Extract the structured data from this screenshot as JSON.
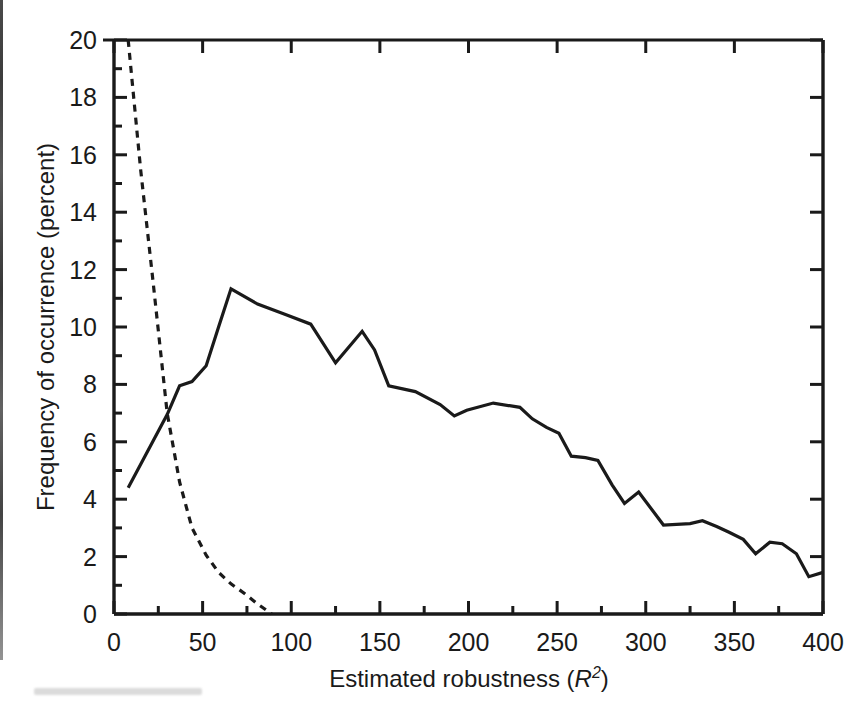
{
  "chart_data": {
    "type": "line",
    "title": "",
    "subtitle": "",
    "xlabel": "Estimated robustness (R2)",
    "xlabel_parts": {
      "prefix": "Estimated robustness (",
      "italic_symbol": "R",
      "superscript": "2",
      "suffix": ")"
    },
    "ylabel": "Frequency of occurrence (percent)",
    "xlim": [
      0,
      400
    ],
    "ylim": [
      0,
      20
    ],
    "xticks": [
      0,
      50,
      100,
      150,
      200,
      250,
      300,
      350,
      400
    ],
    "xtick_labels": [
      "0",
      "50",
      "100",
      "150",
      "200",
      "250",
      "300",
      "350",
      "400"
    ],
    "x_minor_tick_interval": 25,
    "yticks": [
      0,
      2,
      4,
      6,
      8,
      10,
      12,
      14,
      16,
      18,
      20
    ],
    "ytick_labels": [
      "0",
      "2",
      "4",
      "6",
      "8",
      "10",
      "12",
      "14",
      "16",
      "18",
      "20"
    ],
    "y_minor_tick_interval": 1,
    "grid": false,
    "legend": false,
    "legend_position": "none",
    "axis_color": "#1a1a1a",
    "background_color": "#ffffff",
    "series": [
      {
        "name": "solid-distribution",
        "style": "solid",
        "color": "#1a1a1a",
        "line_width": 3.2,
        "x": [
          8,
          30,
          37,
          44,
          52,
          59,
          66,
          81,
          96,
          111,
          125,
          140,
          147,
          155,
          170,
          184,
          192,
          199,
          214,
          229,
          236,
          244,
          251,
          258,
          266,
          273,
          281,
          288,
          296,
          310,
          325,
          332,
          340,
          347,
          355,
          362,
          370,
          377,
          385,
          392,
          400
        ],
        "y": [
          4.4,
          6.95,
          7.95,
          8.1,
          8.65,
          10.0,
          11.33,
          10.8,
          10.45,
          10.1,
          8.75,
          9.85,
          9.2,
          7.95,
          7.75,
          7.3,
          6.9,
          7.1,
          7.35,
          7.2,
          6.8,
          6.5,
          6.3,
          5.5,
          5.45,
          5.35,
          4.5,
          3.85,
          4.25,
          3.1,
          3.15,
          3.25,
          3.05,
          2.85,
          2.6,
          2.1,
          2.5,
          2.45,
          2.1,
          1.3,
          1.45
        ]
      },
      {
        "name": "dashed-distribution",
        "style": "dashed",
        "color": "#1a1a1a",
        "line_width": 3.2,
        "dash_pattern": "7 6",
        "x": [
          8,
          15,
          22,
          30,
          37,
          44,
          52,
          59,
          66,
          74,
          81,
          89
        ],
        "y": [
          20.0,
          15.5,
          11.6,
          7.0,
          4.6,
          3.0,
          2.05,
          1.45,
          1.05,
          0.7,
          0.35,
          0.0
        ]
      }
    ],
    "annotations": []
  }
}
